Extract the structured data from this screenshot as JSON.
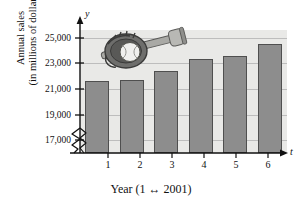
{
  "figure": {
    "axis_letters": {
      "y": "y",
      "x": "t"
    },
    "xaxis_title": "Year (1 ↔ 2001)",
    "yaxis_title_line1": "Annual sales",
    "yaxis_title_line2": "(in millions of dollars)",
    "illustration": "baseball-glove-and-bat-icon",
    "colors": {
      "bar_fill": "#8d8d8d",
      "bar_stroke": "#4f4f4f",
      "plot_background": "#e9e9e7",
      "gridline": "#bdbdbd",
      "axis": "#111111",
      "page_background": "#ffffff"
    }
  },
  "chart_data": {
    "type": "bar",
    "title": "",
    "subtitle": "",
    "xlabel": "Year (1 ↔ 2001)",
    "ylabel": "Annual sales (in millions of dollars)",
    "categories": [
      "1",
      "2",
      "3",
      "4",
      "5",
      "6"
    ],
    "values": [
      21600,
      21700,
      22400,
      23300,
      23600,
      24500
    ],
    "ylim": [
      16000,
      25600
    ],
    "ytick_labels": [
      "17,000",
      "19,000",
      "21,000",
      "23,000",
      "25,000"
    ],
    "ytick_values": [
      17000,
      19000,
      21000,
      23000,
      25000
    ],
    "xtick_labels": [
      "1",
      "2",
      "3",
      "4",
      "5",
      "6"
    ],
    "grid": true,
    "legend": "none",
    "axis_break": "y-axis zigzag break below 17,000",
    "annotations": [
      "baseball glove and bat illustration above bars"
    ]
  }
}
